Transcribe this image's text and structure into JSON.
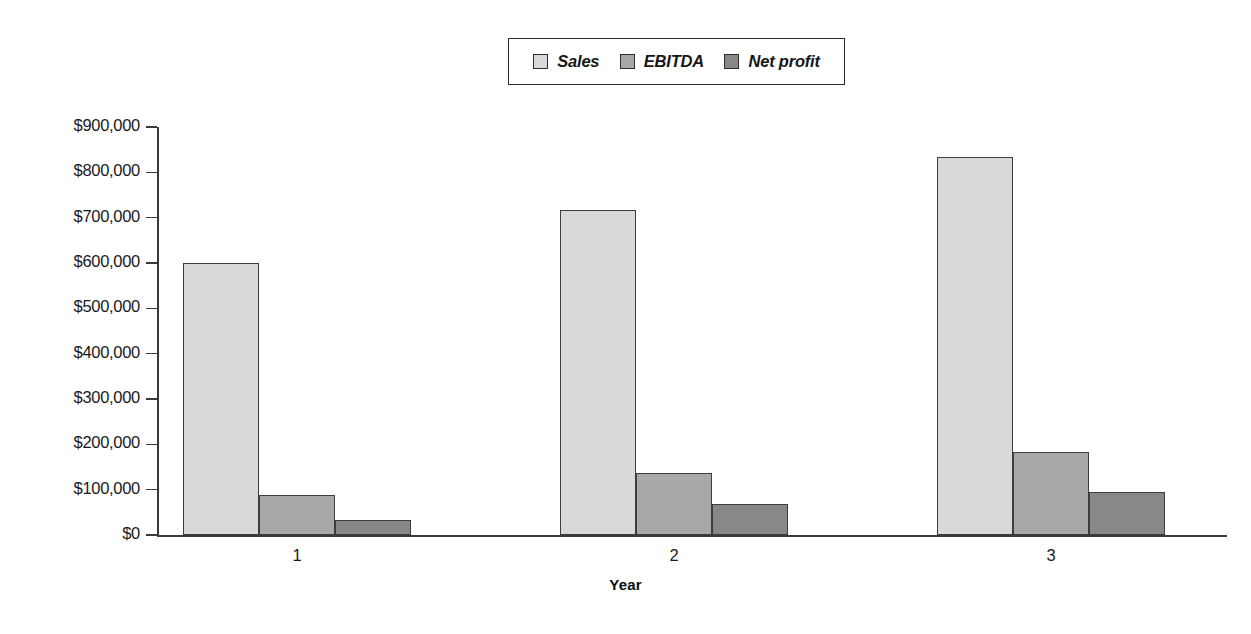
{
  "chart_data": {
    "type": "bar",
    "title": "",
    "subtitle": "",
    "xlabel": "Year",
    "ylabel": "",
    "categories": [
      "1",
      "2",
      "3"
    ],
    "series": [
      {
        "name": "Sales",
        "values": [
          600000,
          716000,
          834000
        ],
        "color": "#d9d9d9"
      },
      {
        "name": "EBITDA",
        "values": [
          88000,
          136000,
          182000
        ],
        "color": "#a8a8a8"
      },
      {
        "name": "Net profit",
        "values": [
          33000,
          69000,
          95000
        ],
        "color": "#888888"
      }
    ],
    "ylim": [
      0,
      900000
    ],
    "ytick_values": [
      0,
      100000,
      200000,
      300000,
      400000,
      500000,
      600000,
      700000,
      800000,
      900000
    ],
    "ytick_labels": [
      "$0",
      "$100,000",
      "$200,000",
      "$300,000",
      "$400,000",
      "$500,000",
      "$600,000",
      "$700,000",
      "$800,000",
      "$900,000"
    ],
    "grid": false,
    "legend_position": "top-center",
    "axis_color": "#3a3a3a",
    "bar_border_color": "#3d3d3d",
    "background_color": "#ffffff"
  },
  "legend": {
    "items": [
      {
        "label": "Sales",
        "color": "#d9d9d9"
      },
      {
        "label": "EBITDA",
        "color": "#a8a8a8"
      },
      {
        "label": "Net profit",
        "color": "#888888"
      }
    ]
  },
  "axes": {
    "x_title": "Year",
    "x_categories": [
      "1",
      "2",
      "3"
    ],
    "y_labels": [
      "$900,000",
      "$800,000",
      "$700,000",
      "$600,000",
      "$500,000",
      "$400,000",
      "$300,000",
      "$200,000",
      "$100,000",
      "$0"
    ]
  }
}
